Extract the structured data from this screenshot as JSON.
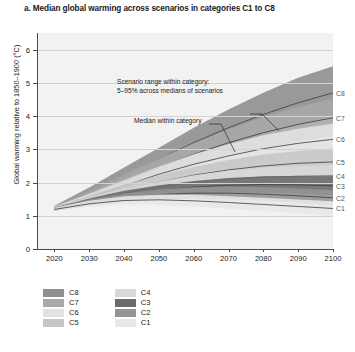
{
  "title": "a. Median global warming across scenarios in categories C1 to C8",
  "axes": {
    "ylabel": "Global warming relative to 1850–1900 (°C)",
    "xlabel": "",
    "yticks": [
      "0",
      "1",
      "2",
      "3",
      "4",
      "5",
      "6"
    ],
    "xticks": [
      "2020",
      "2030",
      "2040",
      "2050",
      "2060",
      "2070",
      "2080",
      "2090",
      "2100"
    ]
  },
  "annotations": {
    "range_line1": "Scenario range within category:",
    "range_line2": "5–95% across medians of scenarios",
    "median": "Median within category"
  },
  "edge_labels": [
    "C8",
    "C7",
    "C6",
    "C5",
    "C4",
    "C3",
    "C2",
    "C1"
  ],
  "legend": {
    "column1": [
      "C8",
      "C7",
      "C6",
      "C5"
    ],
    "column2": [
      "C4",
      "C3",
      "C2",
      "C1"
    ]
  },
  "colors": {
    "plot_background": "#f2f2f2",
    "gridline": "#d2d2d2",
    "axis": "#4a4a4a",
    "C8": "#8f8f8f",
    "C7": "#a8a8a8",
    "C6": "#e2e2e2",
    "C5": "#c6c6c6",
    "C4": "#d8d8d8",
    "C3": "#6b6b6b",
    "C2": "#949494",
    "C1": "#e8e8e8"
  },
  "chart_data": {
    "type": "area",
    "title": "a. Median global warming across scenarios in categories C1 to C8",
    "xlabel": "",
    "ylabel": "Global warming relative to 1850–1900 (°C)",
    "xlim": [
      2015,
      2100
    ],
    "ylim": [
      0,
      6.5
    ],
    "grid": true,
    "legend_position": "below-left",
    "x": [
      2020,
      2030,
      2040,
      2050,
      2060,
      2070,
      2080,
      2090,
      2100
    ],
    "series": [
      {
        "name": "C8",
        "color": "#8f8f8f",
        "median": [
          1.25,
          1.7,
          2.2,
          2.7,
          3.2,
          3.65,
          4.05,
          4.4,
          4.7
        ],
        "lower_5": [
          1.2,
          1.55,
          1.95,
          2.35,
          2.75,
          3.1,
          3.45,
          3.75,
          4.0
        ],
        "upper_95": [
          1.3,
          1.85,
          2.45,
          3.05,
          3.65,
          4.2,
          4.7,
          5.15,
          5.5
        ]
      },
      {
        "name": "C7",
        "color": "#a8a8a8",
        "median": [
          1.24,
          1.62,
          2.05,
          2.45,
          2.85,
          3.2,
          3.5,
          3.75,
          3.95
        ],
        "lower_5": [
          1.19,
          1.5,
          1.85,
          2.2,
          2.5,
          2.8,
          3.05,
          3.25,
          3.4
        ],
        "upper_95": [
          1.29,
          1.74,
          2.25,
          2.72,
          3.18,
          3.6,
          3.97,
          4.28,
          4.52
        ]
      },
      {
        "name": "C6",
        "color": "#e2e2e2",
        "median": [
          1.23,
          1.55,
          1.9,
          2.25,
          2.55,
          2.8,
          3.02,
          3.18,
          3.3
        ],
        "lower_5": [
          1.18,
          1.45,
          1.73,
          2.02,
          2.26,
          2.47,
          2.64,
          2.76,
          2.84
        ],
        "upper_95": [
          1.28,
          1.66,
          2.08,
          2.48,
          2.85,
          3.15,
          3.42,
          3.62,
          3.78
        ]
      },
      {
        "name": "C5",
        "color": "#c6c6c6",
        "median": [
          1.22,
          1.5,
          1.78,
          2.02,
          2.22,
          2.38,
          2.5,
          2.58,
          2.62
        ],
        "lower_5": [
          1.17,
          1.4,
          1.62,
          1.82,
          1.97,
          2.08,
          2.16,
          2.2,
          2.22
        ],
        "upper_95": [
          1.27,
          1.6,
          1.93,
          2.22,
          2.47,
          2.68,
          2.84,
          2.95,
          3.02
        ]
      },
      {
        "name": "C4",
        "color": "#d8d8d8",
        "median": [
          1.21,
          1.46,
          1.68,
          1.86,
          2.0,
          2.1,
          2.16,
          2.19,
          2.2
        ],
        "lower_5": [
          1.16,
          1.36,
          1.54,
          1.68,
          1.78,
          1.84,
          1.87,
          1.88,
          1.87
        ],
        "upper_95": [
          1.26,
          1.56,
          1.82,
          2.04,
          2.22,
          2.36,
          2.45,
          2.5,
          2.53
        ]
      },
      {
        "name": "C3",
        "color": "#6b6b6b",
        "median": [
          1.2,
          1.43,
          1.62,
          1.76,
          1.86,
          1.92,
          1.94,
          1.93,
          1.9
        ],
        "lower_5": [
          1.16,
          1.34,
          1.49,
          1.6,
          1.66,
          1.69,
          1.69,
          1.66,
          1.62
        ],
        "upper_95": [
          1.25,
          1.52,
          1.75,
          1.92,
          2.05,
          2.14,
          2.19,
          2.2,
          2.19
        ]
      },
      {
        "name": "C2",
        "color": "#949494",
        "median": [
          1.2,
          1.4,
          1.55,
          1.64,
          1.68,
          1.68,
          1.65,
          1.6,
          1.54
        ],
        "lower_5": [
          1.15,
          1.31,
          1.43,
          1.49,
          1.51,
          1.49,
          1.45,
          1.39,
          1.32
        ],
        "upper_95": [
          1.25,
          1.49,
          1.67,
          1.79,
          1.86,
          1.88,
          1.86,
          1.82,
          1.77
        ]
      },
      {
        "name": "C1",
        "color": "#e8e8e8",
        "median": [
          1.19,
          1.36,
          1.46,
          1.48,
          1.45,
          1.4,
          1.34,
          1.28,
          1.22
        ],
        "lower_5": [
          1.14,
          1.27,
          1.33,
          1.33,
          1.28,
          1.21,
          1.14,
          1.07,
          1.0
        ],
        "upper_95": [
          1.24,
          1.45,
          1.59,
          1.64,
          1.63,
          1.59,
          1.54,
          1.49,
          1.44
        ]
      }
    ]
  }
}
